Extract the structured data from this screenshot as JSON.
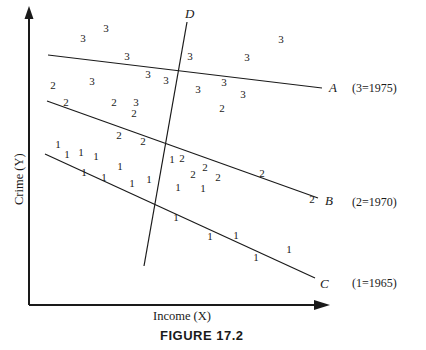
{
  "figure": {
    "caption": "FIGURE 17.2",
    "x_axis_label": "Income (X)",
    "y_axis_label": "Crime (Y)"
  },
  "legend": {
    "position": "right",
    "entries": [
      {
        "symbol": "3",
        "year": "1975",
        "text": "(3=1975)",
        "y": 88
      },
      {
        "symbol": "2",
        "year": "1970",
        "text": "(2=1970)",
        "y": 202
      },
      {
        "symbol": "1",
        "year": "1965",
        "text": "(1=1965)",
        "y": 283
      }
    ]
  },
  "lines": [
    {
      "name": "A",
      "label": "A",
      "group": "3",
      "x1": 48,
      "y1": 55,
      "x2": 322,
      "y2": 88
    },
    {
      "name": "B",
      "label": "B",
      "group": "2",
      "x1": 47,
      "y1": 101,
      "x2": 318,
      "y2": 198
    },
    {
      "name": "C",
      "label": "C",
      "group": "1",
      "x1": 45,
      "y1": 154,
      "x2": 315,
      "y2": 278
    },
    {
      "name": "D",
      "label": "D",
      "group": "cross-section",
      "x1": 187,
      "y1": 22,
      "x2": 144,
      "y2": 266
    }
  ],
  "chart_data": {
    "type": "scatter",
    "title": "FIGURE 17.2",
    "xlabel": "Income (X)",
    "ylabel": "Crime (Y)",
    "grid": false,
    "axis_arrows": true,
    "legend_position": "right",
    "legend": [
      "(3=1975)",
      "(2=1970)",
      "(1=1965)"
    ],
    "series": [
      {
        "name": "1965",
        "marker_text": "1",
        "fit_line": "C",
        "points": [
          [
            58,
            148
          ],
          [
            67,
            158
          ],
          [
            81,
            156
          ],
          [
            96,
            160
          ],
          [
            84,
            176
          ],
          [
            104,
            180
          ],
          [
            120,
            170
          ],
          [
            132,
            186
          ],
          [
            149,
            183
          ],
          [
            179,
            190
          ],
          [
            172,
            163
          ],
          [
            176,
            220
          ],
          [
            209,
            239
          ],
          [
            237,
            238
          ],
          [
            256,
            260
          ],
          [
            288,
            252
          ]
        ]
      },
      {
        "name": "1970",
        "marker_text": "2",
        "fit_line": "B",
        "points": [
          [
            53,
            88
          ],
          [
            65,
            105
          ],
          [
            114,
            105
          ],
          [
            133,
            116
          ],
          [
            118,
            137
          ],
          [
            143,
            143
          ],
          [
            181,
            160
          ],
          [
            204,
            170
          ],
          [
            183,
            178
          ],
          [
            217,
            180
          ],
          [
            262,
            176
          ],
          [
            311,
            204
          ],
          [
            222,
            110
          ]
        ]
      },
      {
        "name": "1975",
        "marker_text": "3",
        "fit_line": "A",
        "points": [
          [
            83,
            42
          ],
          [
            106,
            32
          ],
          [
            126,
            59
          ],
          [
            147,
            77
          ],
          [
            165,
            82
          ],
          [
            189,
            59
          ],
          [
            197,
            92
          ],
          [
            223,
            85
          ],
          [
            246,
            60
          ],
          [
            281,
            43
          ],
          [
            136,
            105
          ],
          [
            92,
            84
          ],
          [
            222,
            107
          ]
        ]
      }
    ],
    "annotations": [
      {
        "text": "A",
        "x": 334,
        "y": 88,
        "style": "italic",
        "meaning": "regression line for 1975"
      },
      {
        "text": "B",
        "x": 330,
        "y": 201,
        "style": "italic",
        "meaning": "regression line for 1970"
      },
      {
        "text": "C",
        "x": 325,
        "y": 284,
        "style": "italic",
        "meaning": "regression line for 1965"
      },
      {
        "text": "D",
        "x": 190,
        "y": 18,
        "style": "italic",
        "meaning": "cross-sectional line"
      }
    ]
  },
  "points": {
    "ones": [
      {
        "v": "1",
        "x": 58,
        "y": 148
      },
      {
        "v": "1",
        "x": 67,
        "y": 158
      },
      {
        "v": "1",
        "x": 81,
        "y": 156
      },
      {
        "v": "1",
        "x": 96,
        "y": 160
      },
      {
        "v": "1",
        "x": 84,
        "y": 176
      },
      {
        "v": "1",
        "x": 104,
        "y": 181
      },
      {
        "v": "1",
        "x": 120,
        "y": 170
      },
      {
        "v": "1",
        "x": 132,
        "y": 187
      },
      {
        "v": "1",
        "x": 149,
        "y": 183
      },
      {
        "v": "1",
        "x": 178,
        "y": 191
      },
      {
        "v": "1",
        "x": 172,
        "y": 163
      },
      {
        "v": "1",
        "x": 176,
        "y": 221
      },
      {
        "v": "1",
        "x": 210,
        "y": 240
      },
      {
        "v": "1",
        "x": 236,
        "y": 239
      },
      {
        "v": "1",
        "x": 256,
        "y": 261
      },
      {
        "v": "1",
        "x": 289,
        "y": 253
      },
      {
        "v": "1",
        "x": 203,
        "y": 192
      }
    ],
    "twos": [
      {
        "v": "2",
        "x": 53,
        "y": 89
      },
      {
        "v": "2",
        "x": 66,
        "y": 106
      },
      {
        "v": "2",
        "x": 114,
        "y": 106
      },
      {
        "v": "2",
        "x": 134,
        "y": 117
      },
      {
        "v": "2",
        "x": 119,
        "y": 139
      },
      {
        "v": "2",
        "x": 143,
        "y": 145
      },
      {
        "v": "2",
        "x": 182,
        "y": 162
      },
      {
        "v": "2",
        "x": 205,
        "y": 171
      },
      {
        "v": "2",
        "x": 193,
        "y": 178
      },
      {
        "v": "2",
        "x": 218,
        "y": 181
      },
      {
        "v": "2",
        "x": 262,
        "y": 177
      },
      {
        "v": "2",
        "x": 312,
        "y": 203
      },
      {
        "v": "2",
        "x": 222,
        "y": 112
      }
    ],
    "threes": [
      {
        "v": "3",
        "x": 83,
        "y": 42
      },
      {
        "v": "3",
        "x": 106,
        "y": 32
      },
      {
        "v": "3",
        "x": 127,
        "y": 60
      },
      {
        "v": "3",
        "x": 148,
        "y": 78
      },
      {
        "v": "3",
        "x": 166,
        "y": 84
      },
      {
        "v": "3",
        "x": 190,
        "y": 60
      },
      {
        "v": "3",
        "x": 198,
        "y": 93
      },
      {
        "v": "3",
        "x": 224,
        "y": 86
      },
      {
        "v": "3",
        "x": 247,
        "y": 61
      },
      {
        "v": "3",
        "x": 281,
        "y": 43
      },
      {
        "v": "3",
        "x": 136,
        "y": 106
      },
      {
        "v": "3",
        "x": 92,
        "y": 85
      },
      {
        "v": "3",
        "x": 243,
        "y": 98
      }
    ]
  },
  "axes": {
    "y": {
      "x": 29,
      "top": 8,
      "bottom": 305
    },
    "x": {
      "y": 305,
      "left": 29,
      "right": 330
    }
  }
}
